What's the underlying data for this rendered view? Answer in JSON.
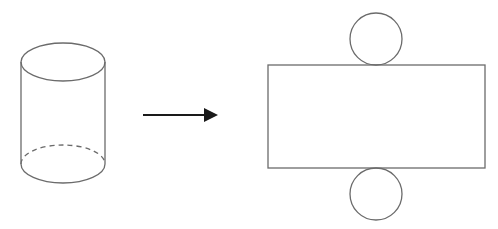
{
  "diagram": {
    "colors": {
      "stroke": "#6b6b6b",
      "arrow": "#1a1a1a",
      "background": "#ffffff"
    },
    "cylinder": {
      "cx": 63,
      "top_cy": 62,
      "bottom_cy": 164,
      "rx": 42,
      "ry": 19,
      "hidden_edge": "dashed"
    },
    "arrow": {
      "x1": 143,
      "x2": 217,
      "y": 115,
      "direction": "right"
    },
    "net": {
      "rectangle": {
        "x": 268,
        "y": 65,
        "width": 217,
        "height": 103
      },
      "top_circle": {
        "cx": 376,
        "cy": 39,
        "r": 26
      },
      "bottom_circle": {
        "cx": 376,
        "cy": 194,
        "r": 26
      }
    }
  }
}
